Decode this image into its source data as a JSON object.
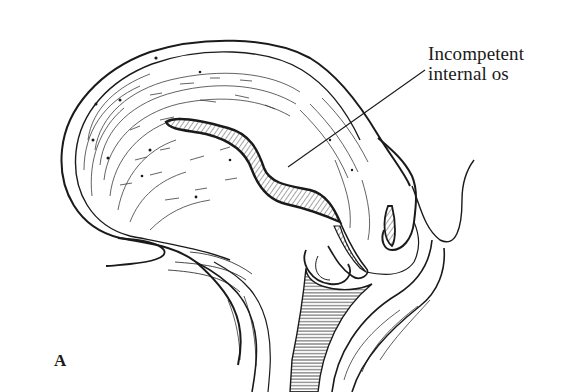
{
  "figure": {
    "panel_label": "A",
    "annotations": [
      {
        "line1": "Incompetent",
        "line2": "internal os",
        "leader_from": [
          425,
          70
        ],
        "leader_to": [
          288,
          167
        ]
      }
    ],
    "colors": {
      "ink": "#1a1a1a",
      "background": "#ffffff"
    }
  }
}
